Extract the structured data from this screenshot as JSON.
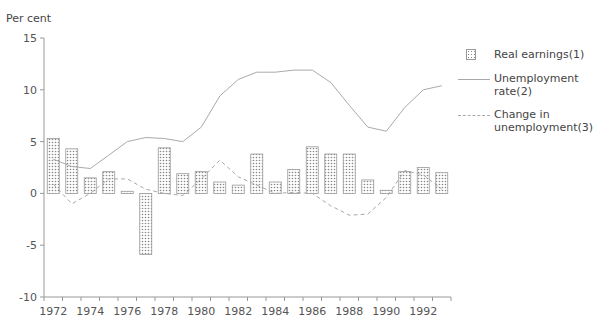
{
  "chart_data": {
    "type": "bar",
    "title": "",
    "ylabel": "Per cent",
    "xlabel": "",
    "ylim": [
      -10,
      15
    ],
    "yticks": [
      15,
      10,
      5,
      0,
      -5,
      -10
    ],
    "x": [
      1972,
      1973,
      1974,
      1975,
      1976,
      1977,
      1978,
      1979,
      1980,
      1981,
      1982,
      1983,
      1984,
      1985,
      1986,
      1987,
      1988,
      1989,
      1990,
      1991,
      1992,
      1993
    ],
    "xtick_labels": [
      "1972",
      "1974",
      "1976",
      "1978",
      "1980",
      "1982",
      "1984",
      "1986",
      "1988",
      "1990",
      "1992"
    ],
    "grid": false,
    "legend_position": "right",
    "series": [
      {
        "name": "Real earnings(1)",
        "type": "bar",
        "style": "stippled",
        "values": [
          5.3,
          4.3,
          1.5,
          2.1,
          0.2,
          -5.9,
          4.4,
          1.9,
          2.1,
          1.1,
          0.8,
          3.8,
          1.1,
          2.3,
          4.5,
          3.8,
          3.8,
          1.3,
          0.3,
          2.1,
          2.5,
          2.0
        ]
      },
      {
        "name": "Unemployment rate(2)",
        "type": "line",
        "style": "solid",
        "values": [
          3.3,
          2.6,
          2.4,
          3.7,
          5.0,
          5.4,
          5.3,
          5.0,
          6.4,
          9.4,
          11.0,
          11.7,
          11.7,
          11.9,
          11.9,
          10.7,
          8.5,
          6.4,
          6.0,
          8.3,
          10.0,
          10.4
        ]
      },
      {
        "name": "Change in unemployment(3)",
        "type": "line",
        "style": "dashed",
        "values": [
          0.9,
          -1.0,
          0.0,
          1.4,
          1.4,
          0.4,
          0.0,
          -0.2,
          1.4,
          3.2,
          1.6,
          0.8,
          0.0,
          0.1,
          0.0,
          -1.2,
          -2.1,
          -2.0,
          -0.4,
          2.2,
          1.8,
          0.4
        ]
      }
    ]
  },
  "legend": {
    "items": [
      {
        "label": "Real earnings(1)",
        "key": "stippled-bar"
      },
      {
        "label": "Unemployment rate(2)",
        "key": "solid-line"
      },
      {
        "label": "Change in unemployment(3)",
        "key": "dashed-line"
      }
    ]
  },
  "colors": {
    "axis": "#999999",
    "line": "#aaaaaa",
    "bar_border": "#999999",
    "bar_dot": "#888888"
  }
}
